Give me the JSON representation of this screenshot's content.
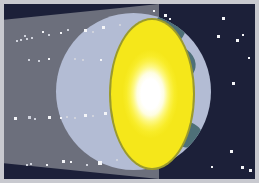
{
  "image": {
    "title": "Earth casting a shadow cone in space with bright solar glow",
    "domain": "illustration",
    "width": 259,
    "height": 183,
    "alt_text": "Diagram of Earth lit by a bright yellow-white light source, with a grey conical shadow extending to the left across a dark navy star field."
  },
  "palette": {
    "space_background": "#1c2039",
    "shadow_cone": "#6c6f7c",
    "earth_ocean": "#b3bcd4",
    "earth_land": "#4e7078",
    "glow_rim": "#9a9a2d",
    "glow_outer": "#f5e71a",
    "glow_mid": "#fbf14a",
    "glow_core": "#ffffff",
    "star": "#f4f5f8",
    "frame_border": "#c8c9cf"
  },
  "elements": {
    "space_label": "space background",
    "cone_label": "shadow cone",
    "earth_label": "earth sphere",
    "glow_label": "solar glow",
    "core_label": "glow core",
    "frame_label": "image frame"
  },
  "stars": {
    "in_cone": [
      {
        "x": 16,
        "y": 35,
        "s": 2,
        "dim": true
      },
      {
        "x": 22,
        "y": 34,
        "s": 2,
        "dim": true
      },
      {
        "x": 27,
        "y": 33,
        "s": 2,
        "dim": true
      },
      {
        "x": 20,
        "y": 31,
        "s": 2,
        "dim": true
      },
      {
        "x": 12,
        "y": 36,
        "s": 2,
        "dim": true
      },
      {
        "x": 38,
        "y": 27,
        "s": 2,
        "dim": false
      },
      {
        "x": 44,
        "y": 30,
        "s": 2,
        "dim": true
      },
      {
        "x": 56,
        "y": 28,
        "s": 2,
        "dim": false
      },
      {
        "x": 63,
        "y": 25,
        "s": 2,
        "dim": true
      },
      {
        "x": 80,
        "y": 25,
        "s": 3,
        "dim": false
      },
      {
        "x": 88,
        "y": 27,
        "s": 2,
        "dim": true
      },
      {
        "x": 98,
        "y": 22,
        "s": 3,
        "dim": false
      },
      {
        "x": 115,
        "y": 20,
        "s": 2,
        "dim": true
      },
      {
        "x": 24,
        "y": 55,
        "s": 2,
        "dim": true
      },
      {
        "x": 34,
        "y": 56,
        "s": 2,
        "dim": true
      },
      {
        "x": 44,
        "y": 54,
        "s": 2,
        "dim": false
      },
      {
        "x": 70,
        "y": 54,
        "s": 2,
        "dim": true
      },
      {
        "x": 78,
        "y": 55,
        "s": 2,
        "dim": true
      },
      {
        "x": 96,
        "y": 55,
        "s": 2,
        "dim": false
      },
      {
        "x": 10,
        "y": 113,
        "s": 3,
        "dim": false
      },
      {
        "x": 24,
        "y": 112,
        "s": 3,
        "dim": true
      },
      {
        "x": 30,
        "y": 114,
        "s": 2,
        "dim": true
      },
      {
        "x": 44,
        "y": 112,
        "s": 3,
        "dim": false
      },
      {
        "x": 56,
        "y": 113,
        "s": 2,
        "dim": false
      },
      {
        "x": 62,
        "y": 112,
        "s": 2,
        "dim": true
      },
      {
        "x": 70,
        "y": 113,
        "s": 2,
        "dim": true
      },
      {
        "x": 80,
        "y": 110,
        "s": 3,
        "dim": false
      },
      {
        "x": 88,
        "y": 111,
        "s": 2,
        "dim": true
      },
      {
        "x": 100,
        "y": 108,
        "s": 3,
        "dim": false
      },
      {
        "x": 22,
        "y": 160,
        "s": 2,
        "dim": true
      },
      {
        "x": 26,
        "y": 159,
        "s": 2,
        "dim": true
      },
      {
        "x": 42,
        "y": 160,
        "s": 2,
        "dim": false
      },
      {
        "x": 58,
        "y": 156,
        "s": 3,
        "dim": false
      },
      {
        "x": 66,
        "y": 157,
        "s": 2,
        "dim": false
      },
      {
        "x": 82,
        "y": 160,
        "s": 2,
        "dim": true
      },
      {
        "x": 94,
        "y": 157,
        "s": 4,
        "dim": false
      },
      {
        "x": 112,
        "y": 155,
        "s": 2,
        "dim": true
      }
    ],
    "in_space": [
      {
        "x": 160,
        "y": 10,
        "s": 3,
        "dim": false
      },
      {
        "x": 165,
        "y": 14,
        "s": 2,
        "dim": false
      },
      {
        "x": 218,
        "y": 13,
        "s": 3,
        "dim": false
      },
      {
        "x": 213,
        "y": 31,
        "s": 3,
        "dim": false
      },
      {
        "x": 232,
        "y": 35,
        "s": 3,
        "dim": false
      },
      {
        "x": 238,
        "y": 30,
        "s": 2,
        "dim": false
      },
      {
        "x": 228,
        "y": 78,
        "s": 3,
        "dim": false
      },
      {
        "x": 244,
        "y": 53,
        "s": 2,
        "dim": false
      },
      {
        "x": 226,
        "y": 146,
        "s": 3,
        "dim": false
      },
      {
        "x": 207,
        "y": 162,
        "s": 2,
        "dim": false
      },
      {
        "x": 237,
        "y": 162,
        "s": 3,
        "dim": false
      },
      {
        "x": 245,
        "y": 165,
        "s": 3,
        "dim": false
      },
      {
        "x": 149,
        "y": 6,
        "s": 2,
        "dim": false
      }
    ]
  }
}
